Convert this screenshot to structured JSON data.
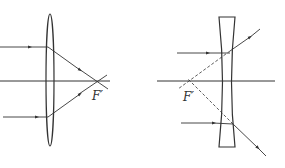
{
  "diagram": {
    "type": "optics-ray-diagram",
    "colors": {
      "line": "#333333",
      "background": "#ffffff"
    },
    "panels": [
      {
        "name": "converging-lens",
        "lens_type": "convex",
        "focal_label": "F′",
        "description": "Parallel rays refract through a convex lens and converge at the focal point F′"
      },
      {
        "name": "diverging-lens",
        "lens_type": "concave",
        "focal_label": "F′",
        "description": "Parallel rays diverge after a concave lens; dashed extensions meet at the virtual focal point F′"
      }
    ]
  }
}
